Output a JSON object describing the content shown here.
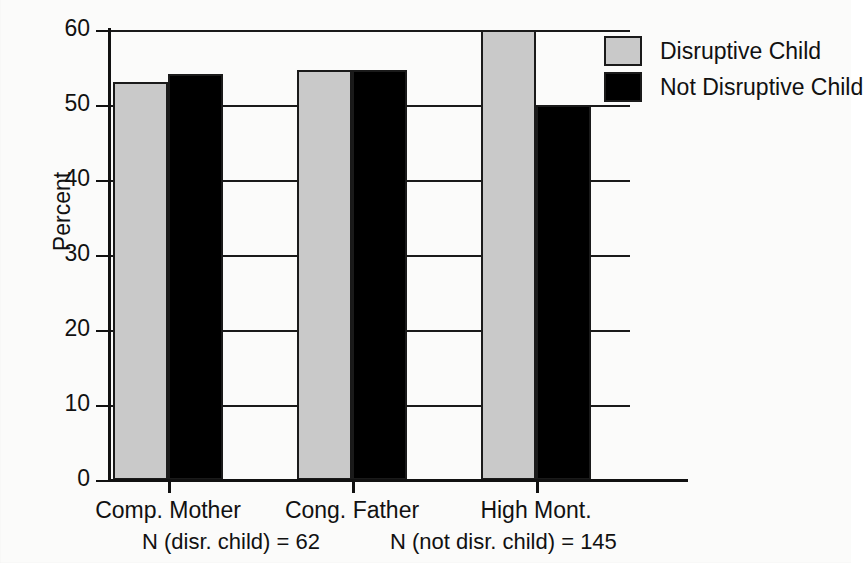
{
  "chart_data": {
    "type": "bar",
    "title": "",
    "xlabel": "",
    "ylabel": "Percent",
    "ylim": [
      0,
      60
    ],
    "yticks": [
      0,
      10,
      20,
      30,
      40,
      50,
      60
    ],
    "grid": true,
    "legend_position": "top-right",
    "categories": [
      "Comp. Mother",
      "Cong. Father",
      "High Mont."
    ],
    "series": [
      {
        "name": "Disruptive Child",
        "color": "#c9c9c9",
        "values": [
          53.1,
          54.7,
          60.0
        ]
      },
      {
        "name": "Not Disruptive Child",
        "color": "#000000",
        "values": [
          54.1,
          54.7,
          50.0
        ]
      }
    ],
    "annotations": [
      "N (disr. child) = 62",
      "N (not disr. child) = 145"
    ]
  },
  "axis": {
    "y_title": "Percent",
    "y_tick_labels": [
      "60",
      "50",
      "40",
      "30",
      "20",
      "10",
      "0"
    ]
  },
  "categories": [
    {
      "label": "Comp. Mother"
    },
    {
      "label": "Cong. Father"
    },
    {
      "label": "High Mont."
    }
  ],
  "notes": {
    "disruptive_n": "N (disr. child) = 62",
    "not_disruptive_n": "N (not disr. child) = 145"
  },
  "legend": {
    "items": [
      {
        "label": "Disruptive Child",
        "color": "#c9c9c9"
      },
      {
        "label": "Not Disruptive Child",
        "color": "#000000"
      }
    ]
  }
}
